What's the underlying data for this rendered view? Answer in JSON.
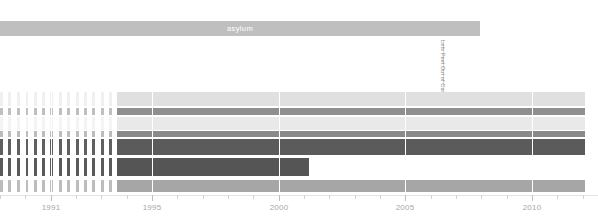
{
  "chart_data": {
    "type": "bar",
    "title": "asylum",
    "subtitle": "",
    "xlabel": "",
    "ylabel": "",
    "orientation": "horizontal-timeline",
    "xlim": [
      1989.0,
      2012.6
    ],
    "grid": true,
    "legend_position": "none",
    "x_ticks": [
      1989,
      1990,
      1991,
      1992,
      1993,
      1994,
      1995,
      1996,
      1997,
      1998,
      1999,
      2000,
      2001,
      2002,
      2003,
      2004,
      2005,
      2006,
      2007,
      2008,
      2009,
      2010,
      2011,
      2012
    ],
    "x_tick_labels": [
      "",
      "",
      "1991",
      "",
      "",
      "",
      "1995",
      "",
      "",
      "",
      "",
      "2000",
      "",
      "",
      "",
      "",
      "2005",
      "",
      "",
      "",
      "",
      "2010",
      "",
      ""
    ],
    "labeled_ticks": [
      {
        "year": 1991,
        "label": "1991",
        "x": 36
      },
      {
        "year": 1995,
        "label": "1995",
        "x": 133
      },
      {
        "year": 2000,
        "label": "2000",
        "x": 262
      },
      {
        "year": 2005,
        "label": "2005",
        "x": 393
      },
      {
        "year": 2010,
        "label": "2010",
        "x": 524
      }
    ],
    "header_bar": {
      "label": "asylum",
      "start_year": 1989.0,
      "end_year": 2007.8,
      "color": "#bfbfbf",
      "text_color": "#ffffff"
    },
    "annotation": {
      "text": "Lets Peel Out of Cairo",
      "year": 2006.9,
      "orientation": "vertical",
      "color": "#8a8a8a"
    },
    "series": [
      {
        "name": "track-1",
        "row": 1,
        "color": "#e0e0e0",
        "solid_start_year": 1993.6,
        "solid_end_year": 2012.1,
        "sparse_start_year": 1989.0,
        "sparse_end_year": 1993.6,
        "sparse_density": "very-low",
        "top": 0,
        "height": 14
      },
      {
        "name": "track-2",
        "row": 2,
        "color": "#8f8f8f",
        "solid_start_year": 1993.6,
        "solid_end_year": 2012.1,
        "sparse_start_year": 1989.0,
        "sparse_end_year": 1993.6,
        "sparse_density": "low",
        "top": 16,
        "height": 7
      },
      {
        "name": "track-3",
        "row": 3,
        "color": "#e9e9e9",
        "solid_start_year": 1993.6,
        "solid_end_year": 2012.1,
        "sparse_start_year": 1989.0,
        "sparse_end_year": 1993.6,
        "sparse_density": "very-low",
        "top": 25,
        "height": 13
      },
      {
        "name": "track-4",
        "row": 4,
        "color": "#8a8a8a",
        "solid_start_year": 1993.6,
        "solid_end_year": 2012.1,
        "sparse_start_year": 1989.0,
        "sparse_end_year": 1993.6,
        "sparse_density": "low",
        "top": 39,
        "height": 6
      },
      {
        "name": "track-5",
        "row": 5,
        "color": "#5b5b5b",
        "solid_start_year": 1993.6,
        "solid_end_year": 2012.1,
        "sparse_start_year": 1989.0,
        "sparse_end_year": 1993.6,
        "sparse_density": "high",
        "top": 47,
        "height": 16
      },
      {
        "name": "track-6",
        "row": 6,
        "color": "#555555",
        "solid_start_year": 1993.6,
        "solid_end_year": 2001.2,
        "sparse_start_year": 1989.0,
        "sparse_end_year": 1993.6,
        "sparse_density": "high",
        "top": 66,
        "height": 18
      },
      {
        "name": "track-7",
        "row": 7,
        "color": "#a6a6a6",
        "solid_start_year": 1993.6,
        "solid_end_year": 2012.1,
        "sparse_start_year": 1989.0,
        "sparse_end_year": 1993.6,
        "sparse_density": "medium",
        "top": 88,
        "height": 12
      }
    ],
    "colors": {
      "background": "#ffffff",
      "gridline": "#ffffff",
      "axis": "#e4e4e4",
      "tick": "#d2d2d2",
      "tick_label": "#a7a7a7",
      "header_bar": "#bfbfbf"
    }
  }
}
